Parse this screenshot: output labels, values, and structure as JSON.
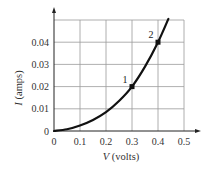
{
  "chart_data": {
    "type": "line",
    "title": "",
    "xlabel": "V (volts)",
    "xlabel_var": "V",
    "xlabel_unit": " (volts)",
    "ylabel": "I (amps)",
    "ylabel_var": "I",
    "ylabel_unit": " (amps)",
    "xlim": [
      0,
      0.5
    ],
    "ylim": [
      0,
      0.05
    ],
    "grid": true,
    "legend": null,
    "x_ticks": [
      "0",
      "0.1",
      "0.2",
      "0.3",
      "0.4",
      "0.5"
    ],
    "y_ticks": [
      "0",
      "0.01",
      "0.02",
      "0.03",
      "0.04"
    ],
    "series": [
      {
        "name": "I-V curve",
        "x": [
          0,
          0.05,
          0.1,
          0.15,
          0.2,
          0.25,
          0.3,
          0.35,
          0.4,
          0.44
        ],
        "y": [
          0,
          0.0008,
          0.0025,
          0.005,
          0.0085,
          0.0135,
          0.02,
          0.029,
          0.04,
          0.0505
        ]
      }
    ],
    "annotations": [
      {
        "label": "1",
        "x": 0.3,
        "y": 0.02
      },
      {
        "label": "2",
        "x": 0.4,
        "y": 0.04
      }
    ]
  },
  "colors": {
    "curve": "#111111",
    "grid": "#9a9a9a",
    "axis": "#222222"
  }
}
